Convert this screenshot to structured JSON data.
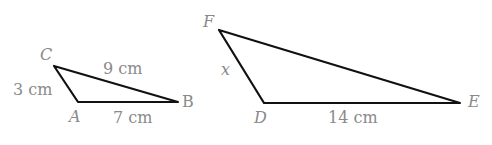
{
  "triangle_abc": {
    "vertices": {
      "A": "A",
      "B": "B",
      "C": "C"
    },
    "sides": {
      "CA": "3 cm",
      "CB": "9 cm",
      "AB": "7 cm"
    }
  },
  "triangle_def": {
    "vertices": {
      "D": "D",
      "E": "E",
      "F": "F"
    },
    "sides": {
      "FD": "x",
      "DE": "14 cm"
    }
  },
  "colors": {
    "line": "#111111",
    "label": "#8a8a8a"
  }
}
